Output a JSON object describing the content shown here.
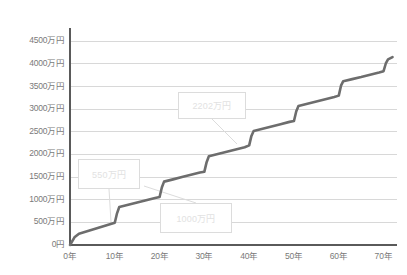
{
  "chart_data": {
    "type": "line",
    "title": "",
    "xlabel": "",
    "ylabel": "",
    "xlim": [
      0,
      73
    ],
    "ylim": [
      0,
      4750
    ],
    "grid": true,
    "legend": "none",
    "y_unit": "万円",
    "x_unit": "年",
    "ytick_labels": [
      "0円",
      "500万円",
      "1000万円",
      "1500万円",
      "2000万円",
      "2500万円",
      "3000万円",
      "3500万円",
      "4000万円",
      "4500万円"
    ],
    "ytick_values": [
      0,
      500,
      1000,
      1500,
      2000,
      2500,
      3000,
      3500,
      4000,
      4500
    ],
    "xtick_labels": [
      "0年",
      "10年",
      "20年",
      "30年",
      "40年",
      "50年",
      "60年",
      "70年"
    ],
    "xtick_values": [
      0,
      10,
      20,
      30,
      40,
      50,
      60,
      70
    ],
    "series": [
      {
        "name": "累計額",
        "color": "#6d6d6d",
        "x": [
          0,
          1,
          2,
          4,
          6,
          8,
          10,
          10.5,
          11,
          13,
          15,
          17,
          19,
          20,
          20.5,
          21,
          23,
          25,
          27,
          29,
          30,
          30.5,
          31,
          33,
          35,
          37,
          39,
          40,
          40.5,
          41,
          43,
          45,
          47,
          49,
          50,
          50.5,
          51,
          53,
          55,
          57,
          59,
          60,
          60.5,
          61,
          63,
          65,
          67,
          69,
          70,
          70.5,
          71,
          72
        ],
        "y": [
          0,
          170,
          250,
          310,
          370,
          430,
          490,
          700,
          840,
          890,
          940,
          990,
          1040,
          1060,
          1270,
          1400,
          1450,
          1500,
          1550,
          1600,
          1620,
          1830,
          1960,
          2010,
          2060,
          2110,
          2160,
          2202,
          2410,
          2520,
          2570,
          2620,
          2670,
          2720,
          2740,
          2950,
          3070,
          3120,
          3170,
          3220,
          3270,
          3300,
          3520,
          3620,
          3665,
          3710,
          3760,
          3810,
          3840,
          4010,
          4100,
          4150
        ]
      }
    ],
    "annotations": [
      {
        "id": "annotation-550",
        "label": "550万円",
        "box": {
          "x": 78,
          "y": 159,
          "w": 62,
          "h": 30
        },
        "leader_to": {
          "x": 111,
          "y": 222
        }
      },
      {
        "id": "annotation-1000",
        "label": "1000万円",
        "box": {
          "x": 160,
          "y": 203,
          "w": 72,
          "h": 30
        },
        "leader_to": {
          "x": 144,
          "y": 186
        }
      },
      {
        "id": "annotation-2202",
        "label": "2202万円",
        "box": {
          "x": 178,
          "y": 92,
          "w": 68,
          "h": 27
        },
        "leader_to": {
          "x": 237,
          "y": 144
        }
      }
    ],
    "axis_color": "#5a5a5a",
    "grid_color": "#d8d8d8",
    "tick_text_color": "#7a7a7a",
    "annotation_text_color": "#e2e2e2",
    "annotation_border_color": "#dcdcdc",
    "plot_area": {
      "left": 70,
      "right": 397,
      "top": 30,
      "bottom": 245
    }
  }
}
